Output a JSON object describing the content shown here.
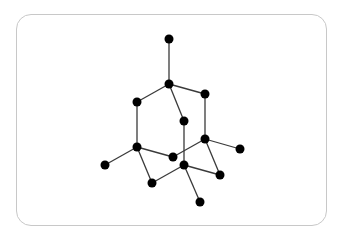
{
  "diagram": {
    "type": "molecular-structure",
    "colors": {
      "node": "#000000",
      "edge": "#3a3a3a",
      "frame_border": "#c8c8c8",
      "background": "#ffffff"
    },
    "node_radius": 4.5,
    "nodes": [
      {
        "id": "n1",
        "x": 169,
        "y": 39
      },
      {
        "id": "n2",
        "x": 169,
        "y": 84
      },
      {
        "id": "n3",
        "x": 137,
        "y": 102
      },
      {
        "id": "n4",
        "x": 205,
        "y": 94
      },
      {
        "id": "n5",
        "x": 184,
        "y": 121
      },
      {
        "id": "n6",
        "x": 137,
        "y": 147
      },
      {
        "id": "n7",
        "x": 205,
        "y": 139
      },
      {
        "id": "n8",
        "x": 105,
        "y": 165
      },
      {
        "id": "n9",
        "x": 173,
        "y": 157
      },
      {
        "id": "n10",
        "x": 240,
        "y": 149
      },
      {
        "id": "n11",
        "x": 184,
        "y": 165
      },
      {
        "id": "n12",
        "x": 152,
        "y": 183
      },
      {
        "id": "n13",
        "x": 220,
        "y": 175
      },
      {
        "id": "n14",
        "x": 200,
        "y": 202
      }
    ],
    "edges": [
      [
        "n1",
        "n2"
      ],
      [
        "n2",
        "n3"
      ],
      [
        "n2",
        "n4"
      ],
      [
        "n2",
        "n5"
      ],
      [
        "n3",
        "n6"
      ],
      [
        "n4",
        "n7"
      ],
      [
        "n5",
        "n11"
      ],
      [
        "n6",
        "n8"
      ],
      [
        "n6",
        "n9"
      ],
      [
        "n6",
        "n12"
      ],
      [
        "n9",
        "n7"
      ],
      [
        "n7",
        "n10"
      ],
      [
        "n7",
        "n13"
      ],
      [
        "n11",
        "n12"
      ],
      [
        "n11",
        "n13"
      ],
      [
        "n11",
        "n14"
      ]
    ]
  }
}
